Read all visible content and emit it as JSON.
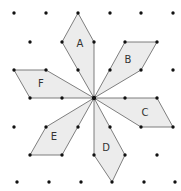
{
  "diagram": {
    "center": [
      94,
      98
    ],
    "colors": {
      "background": "#ffffff",
      "shape_fill": "#ececec",
      "shape_stroke": "#707070",
      "dot": "#111111",
      "label": "#333333"
    },
    "dots": [
      [
        14,
        13
      ],
      [
        46,
        13
      ],
      [
        78,
        13
      ],
      [
        110,
        13
      ],
      [
        141,
        13
      ],
      [
        173,
        13
      ],
      [
        30,
        42
      ],
      [
        62,
        42
      ],
      [
        94,
        42
      ],
      [
        125,
        42
      ],
      [
        157,
        42
      ],
      [
        14,
        70
      ],
      [
        46,
        70
      ],
      [
        78,
        70
      ],
      [
        110,
        70
      ],
      [
        141,
        70
      ],
      [
        173,
        70
      ],
      [
        30,
        98
      ],
      [
        62,
        98
      ],
      [
        94,
        98
      ],
      [
        125,
        98
      ],
      [
        157,
        98
      ],
      [
        14,
        127
      ],
      [
        46,
        127
      ],
      [
        78,
        127
      ],
      [
        110,
        127
      ],
      [
        141,
        127
      ],
      [
        173,
        127
      ],
      [
        30,
        155
      ],
      [
        62,
        155
      ],
      [
        94,
        155
      ],
      [
        125,
        155
      ],
      [
        157,
        155
      ],
      [
        17,
        182
      ],
      [
        49,
        182
      ],
      [
        81,
        182
      ],
      [
        112,
        182
      ],
      [
        144,
        182
      ],
      [
        175,
        182
      ]
    ],
    "shapes": [
      {
        "label": "A",
        "points": [
          [
            78,
            13
          ],
          [
            94,
            42
          ],
          [
            94,
            98
          ],
          [
            62,
            42
          ]
        ],
        "label_pos": [
          80,
          43
        ]
      },
      {
        "label": "B",
        "points": [
          [
            94,
            98
          ],
          [
            125,
            42
          ],
          [
            157,
            42
          ],
          [
            141,
            70
          ]
        ],
        "label_pos": [
          128,
          59
        ]
      },
      {
        "label": "C",
        "points": [
          [
            94,
            98
          ],
          [
            157,
            98
          ],
          [
            173,
            127
          ],
          [
            141,
            127
          ]
        ],
        "label_pos": [
          145,
          112
        ]
      },
      {
        "label": "D",
        "points": [
          [
            94,
            98
          ],
          [
            125,
            155
          ],
          [
            112,
            182
          ],
          [
            94,
            155
          ]
        ],
        "label_pos": [
          106,
          147
        ]
      },
      {
        "label": "E",
        "points": [
          [
            94,
            98
          ],
          [
            62,
            155
          ],
          [
            30,
            155
          ],
          [
            46,
            127
          ]
        ],
        "label_pos": [
          54,
          136
        ]
      },
      {
        "label": "F",
        "points": [
          [
            94,
            98
          ],
          [
            30,
            98
          ],
          [
            14,
            70
          ],
          [
            46,
            70
          ]
        ],
        "label_pos": [
          41,
          83
        ]
      }
    ]
  }
}
